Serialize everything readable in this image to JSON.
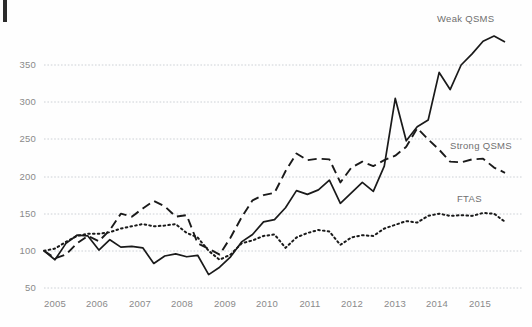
{
  "chart_data": {
    "type": "line",
    "title": "",
    "subtitle": "",
    "xlabel": "",
    "ylabel": "",
    "xlim": [
      2005.0,
      2015.75
    ],
    "ylim": [
      50,
      390
    ],
    "grid": true,
    "gridlines_y": [
      50,
      100,
      150,
      200,
      250,
      300,
      350
    ],
    "legend_position": "inline-right",
    "x_tick_labels": [
      "2005",
      "2006",
      "2007",
      "2008",
      "2009",
      "2010",
      "2011",
      "2012",
      "2013",
      "2014",
      "2015"
    ],
    "y_tick_labels": [
      "50",
      "100",
      "150",
      "200",
      "250",
      "300",
      "350"
    ],
    "x": [
      2005.0,
      2005.25,
      2005.5,
      2005.75,
      2006.0,
      2006.25,
      2006.5,
      2006.75,
      2007.0,
      2007.25,
      2007.5,
      2007.75,
      2008.0,
      2008.25,
      2008.5,
      2008.75,
      2009.0,
      2009.25,
      2009.5,
      2009.75,
      2010.0,
      2010.25,
      2010.5,
      2010.75,
      2011.0,
      2011.25,
      2011.5,
      2011.75,
      2012.0,
      2012.25,
      2012.5,
      2012.75,
      2013.0,
      2013.25,
      2013.5,
      2013.75,
      2014.0,
      2014.25,
      2014.5,
      2014.75,
      2015.0,
      2015.25,
      2015.5
    ],
    "series": [
      {
        "name": "Weak QSMS",
        "style": "solid",
        "color": "#1a1a1a",
        "values": [
          100,
          88,
          110,
          121,
          120,
          101,
          115,
          105,
          106,
          104,
          83,
          93,
          96,
          92,
          94,
          68,
          78,
          92,
          112,
          122,
          139,
          142,
          158,
          181,
          176,
          182,
          195,
          164,
          178,
          192,
          180,
          214,
          305,
          248,
          267,
          276,
          340,
          317,
          350,
          365,
          382,
          389,
          381
        ]
      },
      {
        "name": "Strong QSMS",
        "style": "dashed",
        "color": "#1a1a1a",
        "values": [
          100,
          90,
          95,
          110,
          120,
          113,
          128,
          150,
          146,
          157,
          167,
          160,
          146,
          148,
          110,
          103,
          95,
          118,
          145,
          168,
          175,
          178,
          207,
          231,
          222,
          224,
          223,
          192,
          212,
          220,
          214,
          222,
          228,
          240,
          265,
          250,
          236,
          220,
          219,
          223,
          224,
          212,
          205
        ]
      },
      {
        "name": "FTAS",
        "style": "dotted",
        "color": "#1a1a1a",
        "values": [
          100,
          103,
          112,
          120,
          123,
          123,
          125,
          130,
          133,
          136,
          133,
          134,
          136,
          124,
          118,
          100,
          88,
          95,
          110,
          114,
          120,
          122,
          104,
          118,
          124,
          128,
          126,
          108,
          118,
          121,
          120,
          130,
          135,
          140,
          138,
          147,
          150,
          147,
          148,
          147,
          151,
          150,
          139
        ]
      }
    ],
    "annotations": [
      {
        "text": "Weak QSMS",
        "x_px": 437,
        "y_px": 13
      },
      {
        "text": "Strong QSMS",
        "x_px": 450,
        "y_px": 140
      },
      {
        "text": "FTAS",
        "x_px": 457,
        "y_px": 193
      }
    ]
  },
  "ticks": {
    "y": [
      {
        "label": "350",
        "y_px": 65
      },
      {
        "label": "300",
        "y_px": 102
      },
      {
        "label": "250",
        "y_px": 139
      },
      {
        "label": "200",
        "y_px": 177
      },
      {
        "label": "150",
        "y_px": 214
      },
      {
        "label": "100",
        "y_px": 251
      },
      {
        "label": "50",
        "y_px": 288
      }
    ],
    "x": [
      {
        "label": "2005",
        "x_px": 55
      },
      {
        "label": "2006",
        "x_px": 97
      },
      {
        "label": "2007",
        "x_px": 140
      },
      {
        "label": "2008",
        "x_px": 182
      },
      {
        "label": "2009",
        "x_px": 225
      },
      {
        "label": "2010",
        "x_px": 267
      },
      {
        "label": "2011",
        "x_px": 310
      },
      {
        "label": "2012",
        "x_px": 352
      },
      {
        "label": "2013",
        "x_px": 395
      },
      {
        "label": "2014",
        "x_px": 437
      },
      {
        "label": "2015",
        "x_px": 480
      }
    ]
  },
  "colors": {
    "line": "#1a1a1a",
    "grid": "#c8cdd2",
    "tick_text": "#8a8a8a",
    "label_text": "#6f6f6f",
    "background": "#fefefe"
  }
}
